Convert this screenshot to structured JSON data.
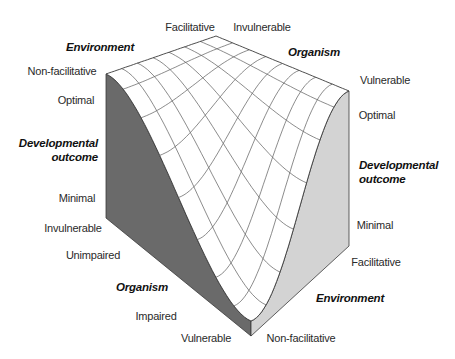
{
  "figure": {
    "type": "3d-surface-diagram",
    "colors": {
      "background": "#ffffff",
      "surface_fill": "#ffffff",
      "grid_line": "#5a5a5a",
      "edge_line": "#3a3a3a",
      "left_face": "#6a6a6a",
      "right_face": "#d3d3d3",
      "text": "#2a2a2a"
    },
    "geometry": {
      "corner_left_top": [
        106,
        74
      ],
      "corner_back_top": [
        216,
        36
      ],
      "corner_right_top": [
        349,
        91
      ],
      "drop_vector": [
        12,
        192
      ],
      "left_face_bottom": [
        106,
        218
      ],
      "right_face_bottom": [
        349,
        246
      ],
      "front_bottom": [
        251,
        336
      ],
      "grid_divisions_u": 7,
      "grid_divisions_v": 8
    }
  },
  "labels": {
    "top_environment_title": "Environment",
    "top_environment_facilitative": "Facilitative",
    "top_environment_non_facilitative": "Non-facilitative",
    "top_organism_title": "Organism",
    "top_organism_invulnerable": "Invulnerable",
    "top_organism_vulnerable": "Vulnerable",
    "left_outcome_title_line1": "Developmental",
    "left_outcome_title_line2": "outcome",
    "left_outcome_optimal": "Optimal",
    "left_outcome_minimal": "Minimal",
    "right_outcome_title_line1": "Developmental",
    "right_outcome_title_line2": "outcome",
    "right_outcome_optimal": "Optimal",
    "right_outcome_minimal": "Minimal",
    "bottom_organism_title": "Organism",
    "bottom_organism_invulnerable": "Invulnerable",
    "bottom_organism_unimpaired": "Unimpaired",
    "bottom_organism_impaired": "Impaired",
    "bottom_organism_vulnerable": "Vulnerable",
    "bottom_environment_title": "Environment",
    "bottom_environment_facilitative": "Facilitative",
    "bottom_environment_non_facilitative": "Non-facilitative"
  }
}
